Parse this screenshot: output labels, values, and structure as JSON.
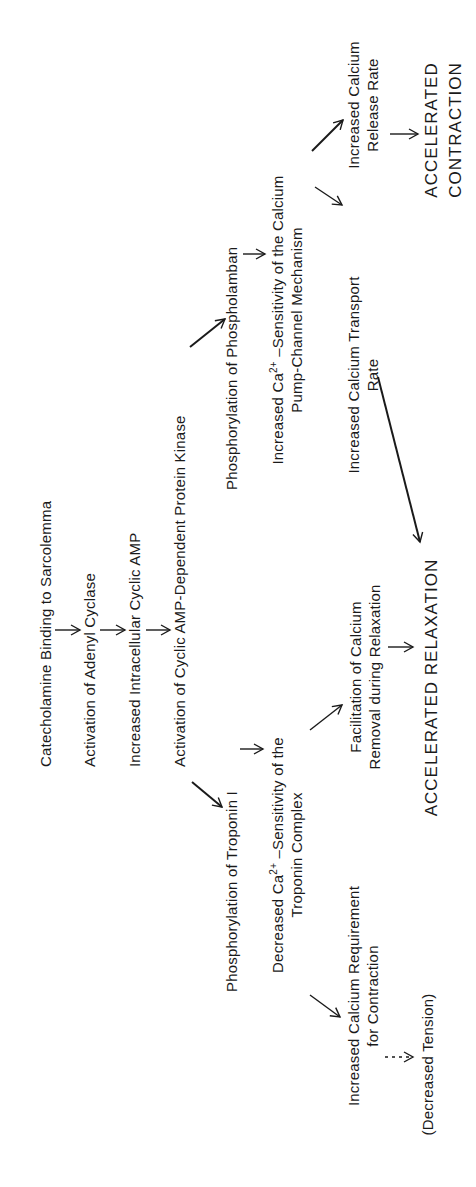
{
  "diagram": {
    "orientation": "rotated-90-ccw",
    "main_chain": [
      {
        "id": "catecholamine",
        "label": "Catecholamine Binding to Sarcolemma"
      },
      {
        "id": "adenyl",
        "label": "Activation of Adenyl Cyclase"
      },
      {
        "id": "camp",
        "label": "Increased Intracellular Cyclic AMP"
      },
      {
        "id": "kinase",
        "label": "Activation of Cyclic AMP-Dependent Protein Kinase"
      }
    ],
    "troponin_branch": {
      "phosphorylation": "Phosphorylation of Troponin I",
      "decreased_line1_pre": "Decreased Ca",
      "decreased_sup": "2+",
      "decreased_line1_post": " –Sensitivity of the",
      "decreased_line2": "Troponin Complex",
      "requirement_line1": "Increased Calcium Requirement",
      "requirement_line2": "for Contraction",
      "tension": "(Decreased Tension)",
      "facilitation_line1": "Facilitation of Calcium",
      "facilitation_line2": "Removal during Relaxation"
    },
    "phospholamban_branch": {
      "phosphorylation": "Phosphorylation of Phospholamban",
      "increased_line1_pre": "Increased Ca",
      "increased_sup": "2+",
      "increased_line1_post": " –Sensitivity of the Calcium",
      "increased_line2": "Pump-Channel Mechanism",
      "transport_line1": "Increased Calcium Transport",
      "transport_line2": "Rate",
      "release_line1": "Increased Calcium",
      "release_line2": "Release Rate"
    },
    "outcomes": {
      "relaxation": "ACCELERATED RELAXATION",
      "contraction_line1": "ACCELERATED",
      "contraction_line2": "CONTRACTION"
    },
    "colors": {
      "ink": "#1a1a1a",
      "background": "#ffffff"
    }
  }
}
